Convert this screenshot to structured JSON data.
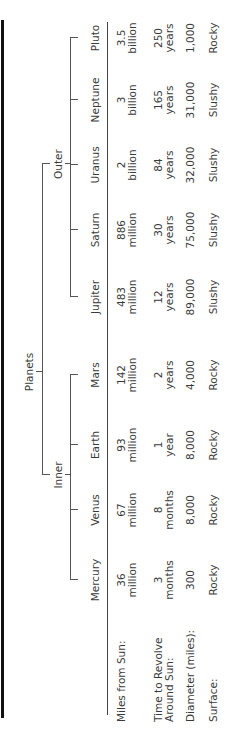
{
  "title": "Planets",
  "groups": [
    {
      "name": "Inner",
      "members": [
        "Mercury",
        "Venus",
        "Earth",
        "Mars"
      ]
    },
    {
      "name": "Outer",
      "members": [
        "Jupiter",
        "Saturn",
        "Uranus",
        "Neptune",
        "Pluto"
      ]
    }
  ],
  "row_labels": {
    "miles": "Miles from Sun:",
    "revolve_1": "Time to Revolve",
    "revolve_2": "Around Sun:",
    "diameter": "Diameter (miles):",
    "surface": "Surface:"
  },
  "planets": [
    {
      "name": "Mercury",
      "miles_1": "36",
      "miles_2": "million",
      "rev_1": "3",
      "rev_2": "months",
      "diameter": "300",
      "surface": "Rocky"
    },
    {
      "name": "Venus",
      "miles_1": "67",
      "miles_2": "million",
      "rev_1": "8",
      "rev_2": "months",
      "diameter": "8,000",
      "surface": "Rocky"
    },
    {
      "name": "Earth",
      "miles_1": "93",
      "miles_2": "million",
      "rev_1": "1",
      "rev_2": "year",
      "diameter": "8,000",
      "surface": "Rocky"
    },
    {
      "name": "Mars",
      "miles_1": "142",
      "miles_2": "million",
      "rev_1": "2",
      "rev_2": "years",
      "diameter": "4,000",
      "surface": "Rocky"
    },
    {
      "name": "Jupiter",
      "miles_1": "483",
      "miles_2": "million",
      "rev_1": "12",
      "rev_2": "years",
      "diameter": "89,000",
      "surface": "Slushy"
    },
    {
      "name": "Saturn",
      "miles_1": "886",
      "miles_2": "million",
      "rev_1": "30",
      "rev_2": "years",
      "diameter": "75,000",
      "surface": "Slushy"
    },
    {
      "name": "Uranus",
      "miles_1": "2",
      "miles_2": "billion",
      "rev_1": "84",
      "rev_2": "years",
      "diameter": "32,000",
      "surface": "Slushy"
    },
    {
      "name": "Neptune",
      "miles_1": "3",
      "miles_2": "billion",
      "rev_1": "165",
      "rev_2": "years",
      "diameter": "31,000",
      "surface": "Slushy"
    },
    {
      "name": "Pluto",
      "miles_1": "3.5",
      "miles_2": "billion",
      "rev_1": "250",
      "rev_2": "years",
      "diameter": "1,000",
      "surface": "Rocky"
    }
  ]
}
